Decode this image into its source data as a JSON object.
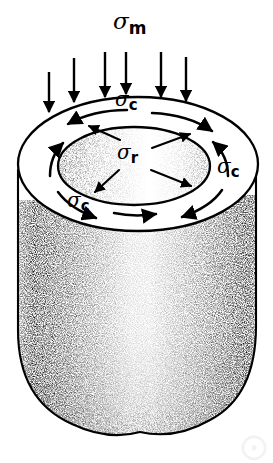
{
  "figure": {
    "title_label": "sigma-m",
    "background_color": "#ffffff",
    "ink_color": "#000000",
    "labels": {
      "meridional": {
        "symbol": "σ",
        "subscript": "m",
        "name": "meridional-stress"
      },
      "circumferential": {
        "symbol": "σ",
        "subscript": "c",
        "name": "circumferential-stress"
      },
      "radial": {
        "symbol": "σ",
        "subscript": "r",
        "name": "radial-stress"
      }
    },
    "label_positions": [
      {
        "id": "sigma-m-top",
        "symbol": "σ",
        "subscript": "m",
        "x": 113,
        "y": 12,
        "size": "big"
      },
      {
        "id": "sigma-c-top",
        "symbol": "σ",
        "subscript": "c",
        "x": 115,
        "y": 88,
        "size": "normal"
      },
      {
        "id": "sigma-r-center",
        "symbol": "σ",
        "subscript": "r",
        "x": 117,
        "y": 140,
        "size": "normal"
      },
      {
        "id": "sigma-c-right",
        "symbol": "σ",
        "subscript": "c",
        "x": 218,
        "y": 155,
        "size": "normal"
      },
      {
        "id": "sigma-c-bottom",
        "symbol": "σ",
        "subscript": "c",
        "x": 67,
        "y": 188,
        "size": "normal"
      }
    ],
    "load_arrows": {
      "name": "meridional-load-arrows",
      "count": 6,
      "direction": "down",
      "arrows": [
        {
          "x": 49,
          "y1": 73,
          "y2": 111
        },
        {
          "x": 74,
          "y1": 59,
          "y2": 101
        },
        {
          "x": 105,
          "y1": 53,
          "y2": 96
        },
        {
          "x": 161,
          "y1": 53,
          "y2": 96
        },
        {
          "x": 186,
          "y1": 58,
          "y2": 100
        }
      ],
      "extra_arrow": {
        "x": 126,
        "y1": 53,
        "y2": 93
      }
    },
    "geometry": {
      "outer_ellipse": {
        "cx": 138,
        "cy": 164,
        "rx": 120,
        "ry": 67
      },
      "inner_ellipse": {
        "cx": 134,
        "cy": 166,
        "rx": 76,
        "ry": 39
      },
      "body_left_x": 18,
      "body_right_x": 256,
      "body_bottom_y": 432
    },
    "watermark_text": "⨀"
  }
}
